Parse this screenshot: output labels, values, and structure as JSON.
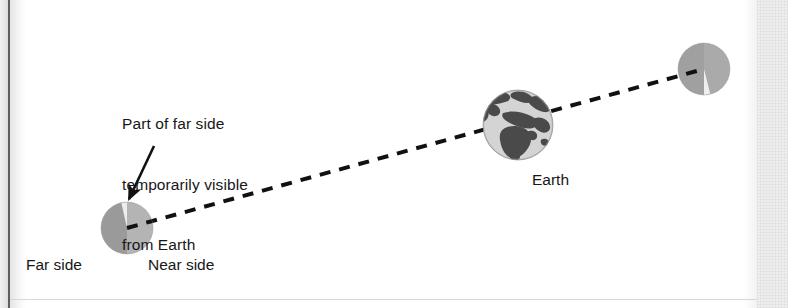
{
  "figure": {
    "type": "astronomy-diagram",
    "callout": {
      "line1": "Part of far side",
      "line2": "temporarily visible",
      "line3": "from Earth"
    },
    "labels": {
      "far_side": "Far side",
      "near_side": "Near side",
      "earth": "Earth"
    },
    "colors": {
      "far_side_gray": "#9a9a9a",
      "near_side_gray": "#b0b0b0",
      "libration_wedge": "#ececec",
      "earth_ocean": "#d2d2d2",
      "earth_land": "#4d4d4d",
      "line_black": "#111111",
      "text_black": "#171717",
      "page_white": "#ffffff",
      "scan_edge_gray": "#eeeeee"
    },
    "bodies": [
      {
        "name": "moon-left",
        "role": "Moon at first position",
        "center_x": 127,
        "center_y": 228,
        "radius": 26,
        "far_side_half": "left",
        "near_side_half": "right",
        "wedge_position": "top",
        "wedge_start_deg": 262,
        "wedge_end_deg": 276
      },
      {
        "name": "earth",
        "role": "Earth",
        "center_x": 518,
        "center_y": 125,
        "radius": 35
      },
      {
        "name": "moon-right",
        "role": "Moon at second position",
        "center_x": 704,
        "center_y": 69,
        "radius": 26,
        "far_side_half": "left",
        "near_side_half": "right",
        "wedge_position": "bottom",
        "wedge_start_deg": 82,
        "wedge_end_deg": 96
      }
    ],
    "sight_line": {
      "style": "dashed",
      "dash_pattern": "11 9",
      "stroke_width": 4,
      "from_x": 127,
      "from_y": 228,
      "to_x": 704,
      "to_y": 69
    },
    "arrow": {
      "name": "callout-arrow",
      "from_x": 154,
      "from_y": 146,
      "to_x": 127,
      "to_y": 202
    }
  }
}
